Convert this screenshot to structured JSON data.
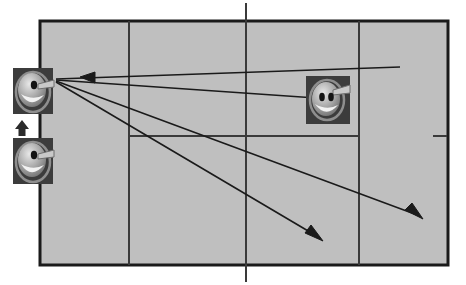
{
  "scene": {
    "title": "Tennis court shot diagram",
    "type": "top-down tennis court with player sprites and shot trajectory arrows",
    "background_color": "#ffffff",
    "court_fill": "#bfbfbf",
    "court_border_color": "#1a1a1a",
    "court_line_color": "#3a3a3a",
    "arrow_color": "#1a1a1a"
  },
  "court": {
    "name": "tennis-court",
    "outer": {
      "x": 40,
      "y": 21,
      "width": 408,
      "height": 244
    },
    "border_width": 3,
    "lines": [
      {
        "name": "left-singles-sideline",
        "orientation": "vertical",
        "x": 129,
        "y1": 21,
        "y2": 265
      },
      {
        "name": "right-singles-sideline",
        "orientation": "vertical",
        "x": 359,
        "y1": 21,
        "y2": 265
      },
      {
        "name": "center-service-line",
        "orientation": "vertical",
        "x": 246,
        "y1": 3,
        "y2": 282
      },
      {
        "name": "service-line",
        "orientation": "horizontal",
        "y": 136,
        "x1": 129,
        "x2": 359
      },
      {
        "name": "right-center-mark",
        "orientation": "horizontal",
        "y": 136,
        "x1": 433,
        "x2": 447
      }
    ]
  },
  "sprites": [
    {
      "name": "player-sprite-left-top",
      "label": "player",
      "x": 13,
      "y": 68,
      "width": 40,
      "height": 46,
      "facing": "right",
      "eyes": 1,
      "tile_color": "#3c3c3c"
    },
    {
      "name": "player-sprite-left-bottom",
      "label": "player",
      "x": 13,
      "y": 138,
      "width": 40,
      "height": 46,
      "facing": "right",
      "eyes": 1,
      "tile_color": "#3c3c3c"
    },
    {
      "name": "player-sprite-right",
      "label": "opponent",
      "x": 306,
      "y": 76,
      "width": 44,
      "height": 48,
      "facing": "left",
      "eyes": 2,
      "tile_color": "#3c3c3c"
    }
  ],
  "move_arrow": {
    "name": "move-up-arrow",
    "x": 16,
    "y": 120,
    "width": 12,
    "height": 16,
    "direction": "up",
    "color": "#2b2b2b"
  },
  "shot_arrows": [
    {
      "name": "incoming-shot-arrow",
      "direction": "leftward",
      "from": {
        "x": 400,
        "y": 67
      },
      "to": {
        "x": 56,
        "y": 79
      },
      "head_at": {
        "x": 87,
        "y": 77
      },
      "head_direction": "left"
    },
    {
      "name": "outgoing-shot-arrow-to-opponent",
      "direction": "rightward",
      "from": {
        "x": 56,
        "y": 80
      },
      "to": {
        "x": 316,
        "y": 98
      },
      "head_at": null,
      "head_direction": "right"
    },
    {
      "name": "outgoing-shot-arrow-deep-right",
      "direction": "down-right",
      "from": {
        "x": 56,
        "y": 81
      },
      "to": {
        "x": 420,
        "y": 216
      },
      "head_at": {
        "x": 420,
        "y": 216
      },
      "head_direction": "down-right"
    },
    {
      "name": "outgoing-shot-arrow-mid-right",
      "direction": "down-right",
      "from": {
        "x": 56,
        "y": 82
      },
      "to": {
        "x": 320,
        "y": 238
      },
      "head_at": {
        "x": 320,
        "y": 238
      },
      "head_direction": "down-right"
    }
  ]
}
